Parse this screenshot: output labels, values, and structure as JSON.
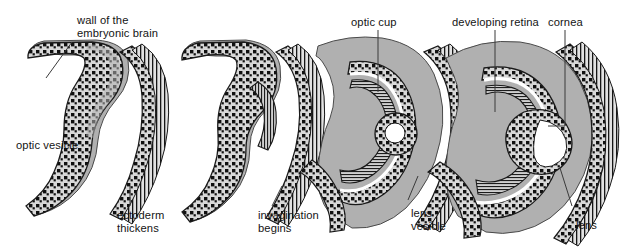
{
  "figure": {
    "type": "biological-process-diagram",
    "stage_count": 4,
    "background_color": "#ffffff",
    "tissue_fill": "#b0b0b0",
    "cell_layer_color": "#1a1a1a",
    "cavity_color": "#ffffff",
    "line_color": "#3a3a3a",
    "text_color": "#141414"
  },
  "labels": {
    "wall_of_brain_line1": "wall of the",
    "wall_of_brain_line2": "embryonic brain",
    "optic_vesicle": "optic vesicle",
    "ectoderm_line1": "ectoderm",
    "ectoderm_line2": "thickens",
    "invagination_line1": "invagination",
    "invagination_line2": "begins",
    "optic_cup": "optic cup",
    "lens_vesicle_line1": "lens",
    "lens_vesicle_line2": "vesicle",
    "developing_retina": "developing retina",
    "cornea": "cornea",
    "lens": "lens"
  },
  "stages": [
    {
      "index": 1,
      "name": "optic-vesicle-stage",
      "labels": [
        "wall of the embryonic brain",
        "optic vesicle",
        "ectoderm thickens"
      ]
    },
    {
      "index": 2,
      "name": "invagination-stage",
      "labels": [
        "invagination begins"
      ]
    },
    {
      "index": 3,
      "name": "optic-cup-stage",
      "labels": [
        "optic cup",
        "lens vesicle"
      ]
    },
    {
      "index": 4,
      "name": "differentiated-eye-stage",
      "labels": [
        "developing retina",
        "cornea",
        "lens"
      ]
    }
  ]
}
